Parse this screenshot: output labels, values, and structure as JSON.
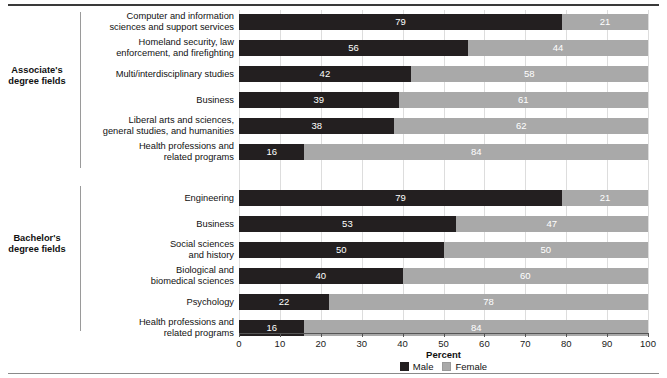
{
  "chart_data": {
    "type": "bar",
    "orientation": "horizontal",
    "stacked": true,
    "title": "",
    "xlabel": "Percent",
    "ylabel": "",
    "xlim": [
      0,
      100
    ],
    "xticks": [
      0,
      10,
      20,
      30,
      40,
      50,
      60,
      70,
      80,
      90,
      100
    ],
    "grid": true,
    "legend_position": "bottom",
    "legend": [
      {
        "name": "Male",
        "color": "#231f20"
      },
      {
        "name": "Female",
        "color": "#a9a9a9"
      }
    ],
    "series": [
      {
        "name": "Male",
        "color": "#231f20"
      },
      {
        "name": "Female",
        "color": "#a9a9a9"
      }
    ],
    "groups": [
      {
        "label": "Associate's\ndegree fields",
        "label_line1": "Associate's",
        "label_line2": "degree fields",
        "categories": [
          {
            "label_line1": "Computer and information",
            "label_line2": "sciences and support services",
            "male": 79,
            "female": 21
          },
          {
            "label_line1": "Homeland security, law",
            "label_line2": "enforcement, and firefighting",
            "male": 56,
            "female": 44
          },
          {
            "label_line1": "Multi/interdisciplinary studies",
            "label_line2": "",
            "male": 42,
            "female": 58
          },
          {
            "label_line1": "Business",
            "label_line2": "",
            "male": 39,
            "female": 61
          },
          {
            "label_line1": "Liberal arts and sciences,",
            "label_line2": "general studies, and humanities",
            "male": 38,
            "female": 62
          },
          {
            "label_line1": "Health professions and",
            "label_line2": "related programs",
            "male": 16,
            "female": 84
          }
        ]
      },
      {
        "label": "Bachelor's\ndegree fields",
        "label_line1": "Bachelor's",
        "label_line2": "degree fields",
        "categories": [
          {
            "label_line1": "Engineering",
            "label_line2": "",
            "male": 79,
            "female": 21
          },
          {
            "label_line1": "Business",
            "label_line2": "",
            "male": 53,
            "female": 47
          },
          {
            "label_line1": "Social sciences",
            "label_line2": "and history",
            "male": 50,
            "female": 50
          },
          {
            "label_line1": "Biological and",
            "label_line2": "biomedical sciences",
            "male": 40,
            "female": 60
          },
          {
            "label_line1": "Psychology",
            "label_line2": "",
            "male": 22,
            "female": 78
          },
          {
            "label_line1": "Health professions and",
            "label_line2": "related programs",
            "male": 16,
            "female": 84
          }
        ]
      }
    ]
  }
}
